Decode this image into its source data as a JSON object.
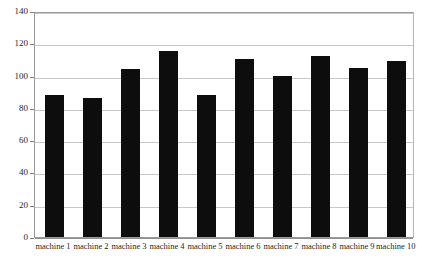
{
  "chart_data": {
    "type": "bar",
    "title": "",
    "subtitle": "",
    "xlabel": "",
    "ylabel": "",
    "categories": [
      "machine 1",
      "machine 2",
      "machine 3",
      "machine 4",
      "machine 5",
      "machine 6",
      "machine 7",
      "machine 8",
      "machine 9",
      "machine 10"
    ],
    "values": [
      88,
      86,
      104,
      115,
      88,
      110,
      100,
      112,
      105,
      109
    ],
    "ylim": [
      0,
      140
    ],
    "ytick_labels": [
      "0",
      "20",
      "40",
      "60",
      "80",
      "100",
      "120",
      "140"
    ],
    "ytick_values": [
      0,
      20,
      40,
      60,
      80,
      100,
      120,
      140
    ],
    "grid": true,
    "grid_axis": "y",
    "legend": false,
    "legend_position": "none",
    "bar_color": "#0d0d0d",
    "grid_color": "#c8c8c8",
    "axis_color": "#8f8f8f",
    "plot_background": "#ffffff"
  }
}
